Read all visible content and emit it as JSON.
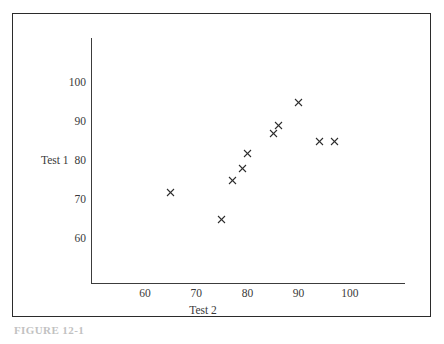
{
  "chart_data": {
    "type": "scatter",
    "title": "",
    "xlabel": "Test 2",
    "ylabel": "Test 1",
    "xlim": [
      50,
      110
    ],
    "ylim": [
      52,
      108
    ],
    "grid": false,
    "legend": "none",
    "marker": "x",
    "marker_color": "#2e2e2e",
    "xticks": [
      60,
      70,
      80,
      90,
      100
    ],
    "yticks": [
      60,
      70,
      80,
      90,
      100
    ],
    "xtick_labels": [
      "60",
      "70",
      "80",
      "90",
      "100"
    ],
    "ytick_labels": [
      "60",
      "70",
      "80",
      "90",
      "100"
    ],
    "points": [
      {
        "x": 65,
        "y": 72
      },
      {
        "x": 75,
        "y": 65
      },
      {
        "x": 77,
        "y": 75
      },
      {
        "x": 79,
        "y": 78
      },
      {
        "x": 80,
        "y": 82
      },
      {
        "x": 85,
        "y": 87
      },
      {
        "x": 86,
        "y": 89
      },
      {
        "x": 90,
        "y": 95
      },
      {
        "x": 94,
        "y": 85
      },
      {
        "x": 97,
        "y": 85
      }
    ]
  },
  "caption": {
    "text": "FIGURE 12-1"
  }
}
